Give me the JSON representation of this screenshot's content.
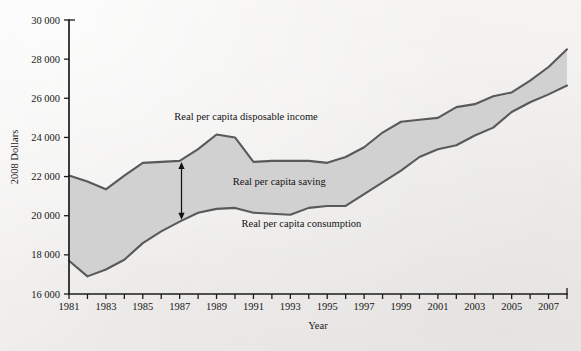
{
  "chart_data": {
    "type": "area",
    "title": "",
    "subtitle": "",
    "xlabel": "Year",
    "ylabel": "2008 Dollars",
    "xlim": [
      1981,
      2008
    ],
    "ylim": [
      16000,
      30000
    ],
    "ytick_step": 2000,
    "grid": false,
    "legend_position": "inline-annotations",
    "x": [
      1981,
      1982,
      1983,
      1984,
      1985,
      1986,
      1987,
      1988,
      1989,
      1990,
      1991,
      1992,
      1993,
      1994,
      1995,
      1996,
      1997,
      1998,
      1999,
      2000,
      2001,
      2002,
      2003,
      2004,
      2005,
      2006,
      2007,
      2008
    ],
    "xtick_labels": [
      "1981",
      "",
      "1983",
      "",
      "1985",
      "",
      "1987",
      "",
      "1989",
      "",
      "1991",
      "",
      "1993",
      "",
      "1995",
      "",
      "1997",
      "",
      "1999",
      "",
      "2001",
      "",
      "2003",
      "",
      "2005",
      "",
      "2007",
      ""
    ],
    "ytick_labels": [
      "16 000",
      "18 000",
      "20 000",
      "22 000",
      "24 000",
      "26 000",
      "28 000",
      "30 000"
    ],
    "ytick_values": [
      16000,
      18000,
      20000,
      22000,
      24000,
      26000,
      28000,
      30000
    ],
    "series": [
      {
        "name": "Real per capita disposable income",
        "key": "disposable_income",
        "values": [
          22050,
          21750,
          21350,
          22050,
          22700,
          22750,
          22800,
          23400,
          24150,
          24000,
          22750,
          22800,
          22800,
          22800,
          22700,
          23000,
          23500,
          24250,
          24800,
          24900,
          25000,
          25550,
          25700,
          26100,
          26300,
          26900,
          27600,
          28500
        ]
      },
      {
        "name": "Real per capita consumption",
        "key": "consumption",
        "values": [
          17700,
          16900,
          17250,
          17750,
          18600,
          19200,
          19700,
          20150,
          20350,
          20400,
          20150,
          20100,
          20050,
          20400,
          20500,
          20500,
          21100,
          21700,
          22300,
          23000,
          23400,
          23600,
          24100,
          24500,
          25300,
          25800,
          26200,
          26650
        ]
      }
    ],
    "band": {
      "name": "Real per capita saving",
      "upper_key": "disposable_income",
      "lower_key": "consumption",
      "fill_color": "#cfcfcf"
    },
    "annotations": [
      {
        "key": "income_label",
        "text": "Real per capita disposable income",
        "x": 1990.6,
        "y": 24900,
        "anchor": "middle"
      },
      {
        "key": "saving_label",
        "text": "Real per capita saving",
        "x": 1992.4,
        "y": 21550,
        "anchor": "middle"
      },
      {
        "key": "consumption_label",
        "text": "Real per capita consumption",
        "x": 1993.6,
        "y": 19400,
        "anchor": "middle"
      }
    ],
    "saving_arrow": {
      "x": 1987.1,
      "y_top": 22750,
      "y_bottom": 19800,
      "double_headed": true
    },
    "colors": {
      "line": "#595959",
      "band_fill": "#cfcfcf",
      "axis": "#1c1c1c",
      "text": "#141414",
      "background": "#f2f2f0"
    }
  }
}
